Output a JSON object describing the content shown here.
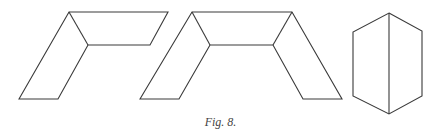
{
  "figure": {
    "caption": "Fig. 8.",
    "stroke_color": "#3a3a3a",
    "shapes": [
      {
        "name": "two-panel-fold",
        "paths": [
          "M19,99 L69,12 L168,12 L150,45 L88,45 L58,99 Z",
          "M69,12 L88,45"
        ]
      },
      {
        "name": "three-panel-fold",
        "paths": [
          "M140,99 L192,12 L292,12 L342,99 L303,99 L273,45 L210,45 L179,99 Z",
          "M192,12 L210,45",
          "M292,12 L273,45"
        ]
      },
      {
        "name": "hexagonal-prism-view",
        "paths": [
          "M389,13 L422,31 L422,96 L389,114 L353,96 L353,32 Z",
          "M389,13 L389,114"
        ]
      }
    ]
  }
}
